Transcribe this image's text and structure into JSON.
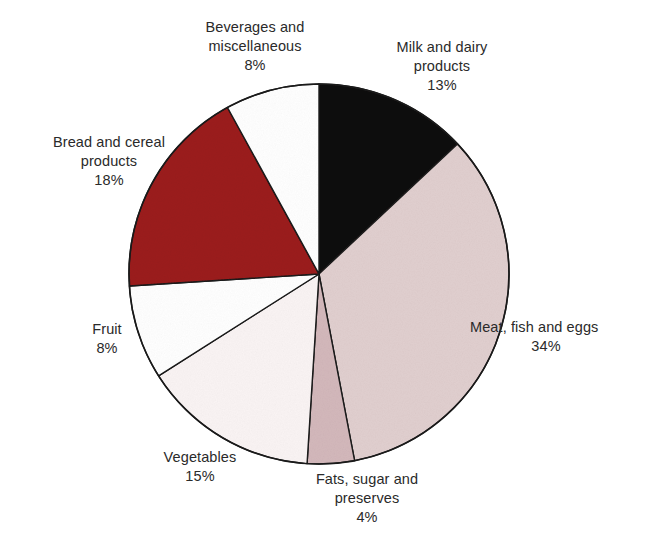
{
  "chart_data": {
    "type": "pie",
    "title": "",
    "subtitle": "",
    "xlabel": "",
    "ylabel": "",
    "legend_position": "none",
    "grid": false,
    "units": "percent",
    "start_angle_deg": 0,
    "direction": "clockwise",
    "categories": [
      "Milk and dairy products",
      "Meat, fish and eggs",
      "Fats, sugar and preserves",
      "Vegetables",
      "Fruit",
      "Bread and cereal products",
      "Beverages and miscellaneous"
    ],
    "values": [
      13,
      34,
      4,
      15,
      8,
      18,
      8
    ],
    "total": 100,
    "slices": [
      {
        "key": "milk",
        "label_lines": [
          "Milk and dairy",
          "products"
        ],
        "label_text": "Milk and dairy products",
        "value": 13,
        "value_text": "13%",
        "color": "#100d0d",
        "stroke": "#1a1a1a"
      },
      {
        "key": "meat",
        "label_lines": [
          "Meat, fish and eggs"
        ],
        "label_text": "Meat, fish and eggs",
        "value": 34,
        "value_text": "34%",
        "color": "#e1cfcf",
        "stroke": "#1a1a1a"
      },
      {
        "key": "fats",
        "label_lines": [
          "Fats, sugar and",
          "preserves"
        ],
        "label_text": "Fats, sugar and preserves",
        "value": 4,
        "value_text": "4%",
        "color": "#d3b8bb",
        "stroke": "#1a1a1a"
      },
      {
        "key": "vegetables",
        "label_lines": [
          "Vegetables"
        ],
        "label_text": "Vegetables",
        "value": 15,
        "value_text": "15%",
        "color": "#faf4f4",
        "stroke": "#1a1a1a"
      },
      {
        "key": "fruit",
        "label_lines": [
          "Fruit"
        ],
        "label_text": "Fruit",
        "value": 8,
        "value_text": "8%",
        "color": "#ffffff",
        "stroke": "#1a1a1a"
      },
      {
        "key": "bread",
        "label_lines": [
          "Bread and cereal",
          "products"
        ],
        "label_text": "Bread and cereal products",
        "value": 18,
        "value_text": "18%",
        "color": "#9b1b1b",
        "stroke": "#1a1a1a"
      },
      {
        "key": "beverages",
        "label_lines": [
          "Beverages and",
          "miscellaneous"
        ],
        "label_text": "Beverages and miscellaneous",
        "value": 8,
        "value_text": "8%",
        "color": "#ffffff",
        "stroke": "#1a1a1a"
      }
    ]
  },
  "labels": {
    "milk": {
      "line1": "Milk and dairy",
      "line2": "products",
      "value": "13%"
    },
    "meat": {
      "line1": "Meat, fish and eggs",
      "line2": "",
      "value": "34%"
    },
    "fats": {
      "line1": "Fats, sugar and",
      "line2": "preserves",
      "value": "4%"
    },
    "vegetables": {
      "line1": "Vegetables",
      "line2": "",
      "value": "15%"
    },
    "fruit": {
      "line1": "Fruit",
      "line2": "",
      "value": "8%"
    },
    "bread": {
      "line1": "Bread and cereal",
      "line2": "products",
      "value": "18%"
    },
    "beverages": {
      "line1": "Beverages and",
      "line2": "miscellaneous",
      "value": "8%"
    }
  },
  "colors": {
    "background": "#ffffff",
    "outline": "#1a1a1a",
    "text": "#2a2a2a",
    "milk": "#100d0d",
    "meat": "#e1cfcf",
    "fats": "#d3b8bb",
    "vegetables": "#faf4f4",
    "fruit": "#ffffff",
    "bread": "#9b1b1b",
    "beverages": "#ffffff"
  },
  "geometry": {
    "center_x": 319,
    "center_y": 274,
    "radius": 190
  }
}
